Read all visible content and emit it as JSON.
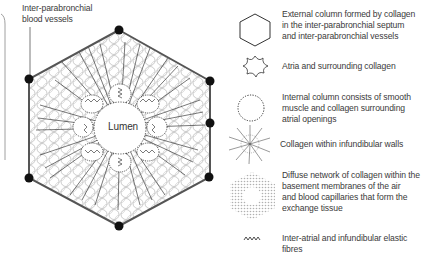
{
  "figure": {
    "callout_label": [
      "Inter-parabronchial",
      "blood vessels"
    ],
    "center_label": "Lumen",
    "colors": {
      "outline": "#555555",
      "vertex_dot": "#111111",
      "circles": "#bdbdbd",
      "fibres": "#222222",
      "dotted_column": "#222222"
    }
  },
  "legend": {
    "items": [
      {
        "icon": "hexagon-icon",
        "lines": [
          "External column formed by collagen",
          "in the inter-parabronchial septum",
          "and inter-parabronchial vessels"
        ]
      },
      {
        "icon": "atria-star-icon",
        "lines": [
          "Atria and surrounding collagen"
        ]
      },
      {
        "icon": "dotted-circle-icon",
        "lines": [
          "Internal column consists of smooth",
          "muscle and collagen surrounding",
          "atrial openings"
        ]
      },
      {
        "icon": "spiky-collagen-icon",
        "lines": [
          "Collagen within infundibular walls"
        ]
      },
      {
        "icon": "diffuse-network-icon",
        "lines": [
          "Diffuse network of collagen within the",
          "basement membranes of the air",
          "and blood capillaries that form the",
          "exchange tissue"
        ]
      },
      {
        "icon": "zigzag-fibre-icon",
        "lines": [
          "Inter-atrial and infundibular elastic",
          "fibres"
        ]
      }
    ]
  }
}
